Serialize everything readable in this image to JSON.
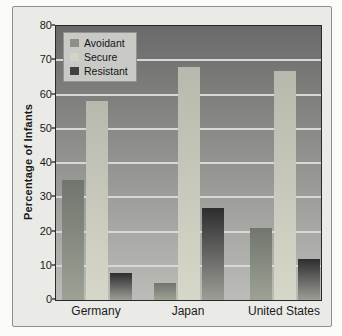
{
  "figure": {
    "page_background": "#fbfbfa",
    "frame_background": "#eaeae7",
    "frame_border": "#8e8e8c"
  },
  "chart_data": {
    "type": "bar",
    "title": "",
    "xlabel": "",
    "ylabel": "Percentage of Infants",
    "categories": [
      "Germany",
      "Japan",
      "United States"
    ],
    "series": [
      {
        "name": "Avoidant",
        "values": [
          35,
          5,
          21
        ],
        "color_top": "#70756e",
        "color_bottom": "#9da295",
        "legend_swatch": "#8b9086"
      },
      {
        "name": "Secure",
        "values": [
          58,
          68,
          67
        ],
        "color_top": "#b7b9ad",
        "color_bottom": "#d7d7c9",
        "legend_swatch": "#d2d4c6"
      },
      {
        "name": "Resistant",
        "values": [
          8,
          27,
          12
        ],
        "color_top": "#2d2d2f",
        "color_bottom": "#9d9d97",
        "legend_swatch": "#3e4044"
      }
    ],
    "ylim": [
      0,
      80
    ],
    "yticks": [
      0,
      10,
      20,
      30,
      40,
      50,
      60,
      70,
      80
    ],
    "grid": true,
    "gridline_color": "#d8d8d4",
    "plot_background_top": "#6a6a6a",
    "plot_background_bottom": "#bcbcb8",
    "legend_position": "top-left"
  }
}
